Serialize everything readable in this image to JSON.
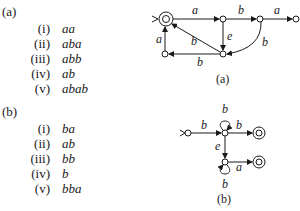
{
  "parts": [
    {
      "label": "(a)",
      "items": [
        {
          "num": "(i)",
          "str": "aa"
        },
        {
          "num": "(ii)",
          "str": "aba"
        },
        {
          "num": "(iii)",
          "str": "abb"
        },
        {
          "num": "(iv)",
          "str": "ab"
        },
        {
          "num": "(v)",
          "str": "abab"
        }
      ],
      "figure_caption": "(a)",
      "edges": {
        "e1": "a",
        "e2": "b",
        "e3": "a",
        "e4": "e",
        "e5": "b",
        "e6": "b",
        "e7": "b",
        "e8": "a"
      }
    },
    {
      "label": "(b)",
      "items": [
        {
          "num": "(i)",
          "str": "ba"
        },
        {
          "num": "(ii)",
          "str": "ab"
        },
        {
          "num": "(iii)",
          "str": "bb"
        },
        {
          "num": "(iv)",
          "str": "b"
        },
        {
          "num": "(v)",
          "str": "bba"
        }
      ],
      "figure_caption": "(b)",
      "edges": {
        "e1": "b",
        "e2": "b",
        "e3": "b",
        "e4": "e",
        "e5": "a",
        "e6": "b"
      }
    }
  ]
}
